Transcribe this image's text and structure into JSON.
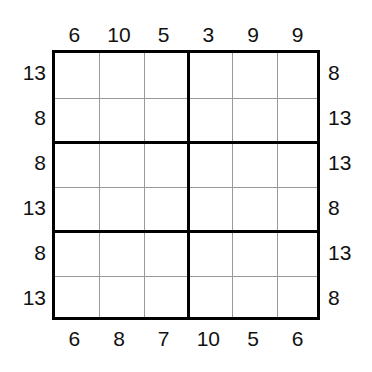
{
  "puzzle": {
    "type": "sum-constraint-grid",
    "grid": {
      "rows": 6,
      "cols": 6,
      "block_rows": 2,
      "block_cols": 3,
      "cells": [
        [
          "",
          "",
          "",
          "",
          "",
          ""
        ],
        [
          "",
          "",
          "",
          "",
          "",
          ""
        ],
        [
          "",
          "",
          "",
          "",
          "",
          ""
        ],
        [
          "",
          "",
          "",
          "",
          "",
          ""
        ],
        [
          "",
          "",
          "",
          "",
          "",
          ""
        ],
        [
          "",
          "",
          "",
          "",
          "",
          ""
        ]
      ]
    },
    "clues": {
      "top": [
        "6",
        "10",
        "5",
        "3",
        "9",
        "9"
      ],
      "bottom": [
        "6",
        "8",
        "7",
        "10",
        "5",
        "6"
      ],
      "left": [
        "13",
        "8",
        "8",
        "13",
        "8",
        "13"
      ],
      "right": [
        "8",
        "13",
        "13",
        "8",
        "13",
        "8"
      ]
    },
    "colors": {
      "background": "#ffffff",
      "thick_line": "#000000",
      "thin_line": "#9a9a9a",
      "label_text": "#111111"
    }
  }
}
